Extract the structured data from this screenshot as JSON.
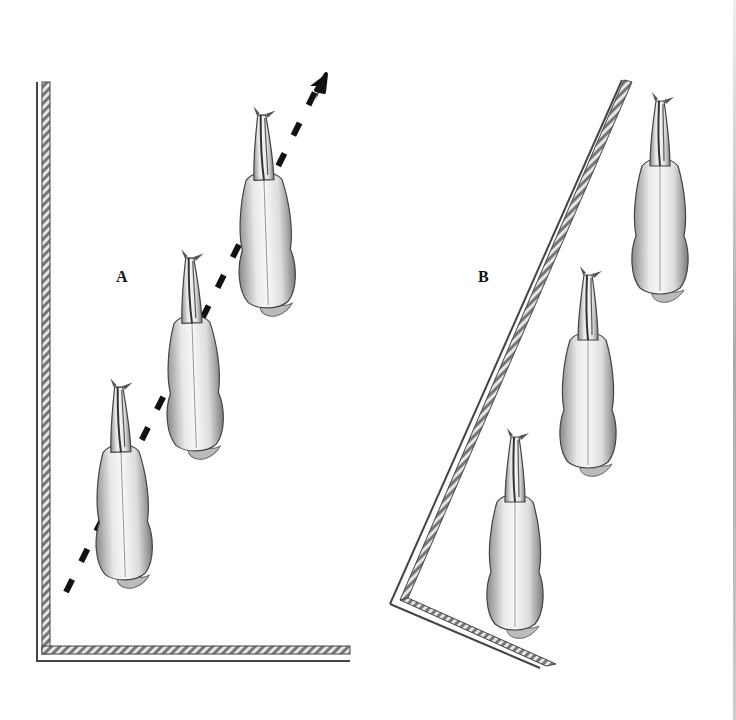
{
  "diagram": {
    "panels": [
      {
        "id": "A",
        "label": "A",
        "description": "Horses travelling diagonally away from the arena corner along a dashed arrow path",
        "horse_count": 3,
        "has_arrow": true
      },
      {
        "id": "B",
        "label": "B",
        "description": "Horses positioned parallel to an angled arena wall",
        "horse_count": 3,
        "has_arrow": false
      }
    ],
    "colors": {
      "ink": "#111111",
      "rail": "#555555",
      "background": "#ffffff",
      "horse_fill": "#f2f2f2",
      "horse_shade": "#9a9a9a"
    }
  }
}
